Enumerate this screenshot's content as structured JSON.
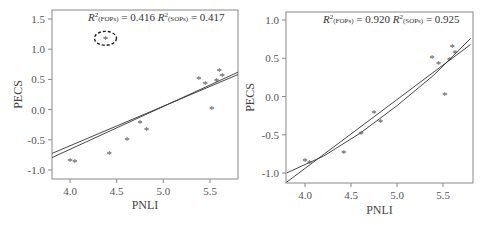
{
  "chart_data": [
    {
      "type": "scatter",
      "panel": "left",
      "xlabel": "PNLI",
      "ylabel": "PECS",
      "xlim": [
        3.8,
        5.8
      ],
      "ylim": [
        -1.15,
        1.65
      ],
      "xticks": [
        "4.0",
        "4.5",
        "5.0",
        "5.5"
      ],
      "yticks": [
        "1.5",
        "1.0",
        "0.5",
        "0.0",
        "-0.5",
        "-1.0"
      ],
      "annotation": {
        "r2_fops_label": "R²(FOPs) = 0.416",
        "r2_sops_label": "R²(SOPs) = 0.417",
        "r2_fops": 0.416,
        "r2_sops": 0.417
      },
      "outlier_circled": {
        "x": 4.38,
        "y": 1.18
      },
      "points": [
        {
          "x": 4.0,
          "y": -0.83
        },
        {
          "x": 4.05,
          "y": -0.85
        },
        {
          "x": 4.42,
          "y": -0.72
        },
        {
          "x": 4.61,
          "y": -0.48
        },
        {
          "x": 4.75,
          "y": -0.2
        },
        {
          "x": 4.82,
          "y": -0.32
        },
        {
          "x": 5.38,
          "y": 0.52
        },
        {
          "x": 5.45,
          "y": 0.44
        },
        {
          "x": 5.52,
          "y": 0.03
        },
        {
          "x": 5.57,
          "y": 0.49
        },
        {
          "x": 5.6,
          "y": 0.66
        },
        {
          "x": 5.63,
          "y": 0.58
        },
        {
          "x": 4.38,
          "y": 1.18
        }
      ],
      "series": [
        {
          "name": "FOPs fit",
          "x": [
            3.8,
            5.8
          ],
          "y": [
            -0.73,
            0.58
          ]
        },
        {
          "name": "SOPs fit",
          "x": [
            3.8,
            5.8
          ],
          "y": [
            -0.8,
            0.62
          ]
        }
      ]
    },
    {
      "type": "scatter",
      "panel": "right",
      "xlabel": "PNLI",
      "ylabel": "PECS",
      "xlim": [
        3.8,
        5.8
      ],
      "ylim": [
        -1.12,
        1.1
      ],
      "xticks": [
        "4.0",
        "4.5",
        "5.0",
        "5.5"
      ],
      "yticks": [
        "1.0",
        "0.5",
        "0.0",
        "-0.5",
        "-1.0"
      ],
      "annotation": {
        "r2_fops_label": "R²(FOPs) = 0.920",
        "r2_sops_label": "R²(SOPs) = 0.925",
        "r2_fops": 0.92,
        "r2_sops": 0.925
      },
      "points": [
        {
          "x": 4.0,
          "y": -0.83
        },
        {
          "x": 4.05,
          "y": -0.85
        },
        {
          "x": 4.42,
          "y": -0.72
        },
        {
          "x": 4.61,
          "y": -0.48
        },
        {
          "x": 4.75,
          "y": -0.2
        },
        {
          "x": 4.82,
          "y": -0.32
        },
        {
          "x": 5.38,
          "y": 0.52
        },
        {
          "x": 5.45,
          "y": 0.44
        },
        {
          "x": 5.52,
          "y": 0.03
        },
        {
          "x": 5.57,
          "y": 0.49
        },
        {
          "x": 5.6,
          "y": 0.66
        },
        {
          "x": 5.63,
          "y": 0.58
        }
      ],
      "series": [
        {
          "name": "FOPs fit",
          "x": [
            3.8,
            5.8
          ],
          "y": [
            -1.12,
            0.68
          ]
        },
        {
          "name": "SOPs fit",
          "x": [
            3.8,
            4.2,
            4.6,
            5.0,
            5.4,
            5.8
          ],
          "y": [
            -1.0,
            -0.78,
            -0.48,
            -0.12,
            0.28,
            0.76
          ]
        }
      ]
    }
  ],
  "labels": {
    "left_x": "PNLI",
    "left_y": "PECS",
    "right_x": "PNLI",
    "right_y": "PECS",
    "R": "R",
    "sup": "2",
    "fops": "(FOPs)",
    "sops": "(SOPs)",
    "left_fops_val": "= 0.416",
    "left_sops_val": "= 0.417",
    "right_fops_val": "= 0.920",
    "right_sops_val": "= 0.925",
    "star": "*"
  }
}
